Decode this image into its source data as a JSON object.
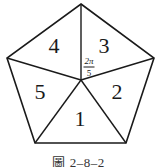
{
  "figure": {
    "caption": "圖 2–8–2",
    "center": [
      81,
      80
    ],
    "vertices": [
      [
        81,
        4
      ],
      [
        154,
        58
      ],
      [
        126,
        143
      ],
      [
        35,
        143
      ],
      [
        7,
        58
      ]
    ],
    "stroke_color": "#1a1a1a",
    "regions": [
      {
        "label": "1",
        "x": 80,
        "y": 119
      },
      {
        "label": "2",
        "x": 117,
        "y": 92
      },
      {
        "label": "3",
        "x": 104,
        "y": 46
      },
      {
        "label": "4",
        "x": 54,
        "y": 46
      },
      {
        "label": "5",
        "x": 40,
        "y": 92
      }
    ],
    "angle_label": {
      "numerator": "2π",
      "denominator": "5",
      "x": 89,
      "y": 67
    }
  }
}
